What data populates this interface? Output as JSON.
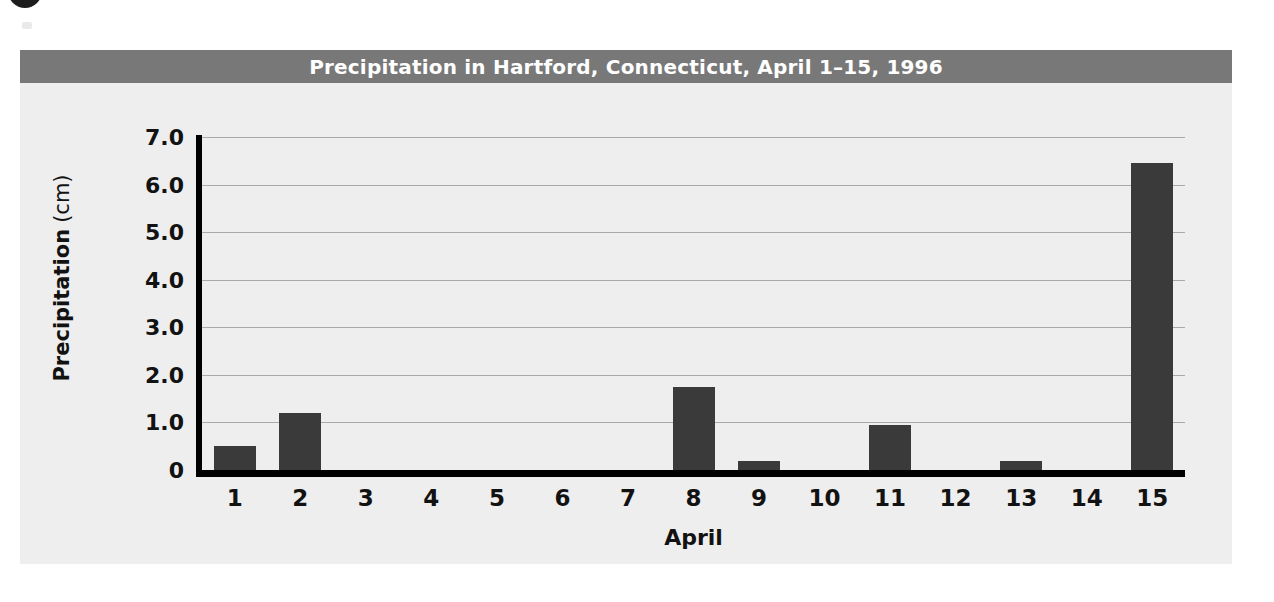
{
  "figure": {
    "title": "Precipitation in Hartford, Connecticut, April 1–15, 1996",
    "title_bar_color": "#787878",
    "title_text_color": "#ffffff",
    "panel_color": "#eeeeee",
    "corner_badge": "dark-circle-bullet"
  },
  "chart_data": {
    "type": "bar",
    "title": "Precipitation in Hartford, Connecticut, April 1–15, 1996",
    "xlabel": "April",
    "ylabel": "Precipitation",
    "ylabel_unit": "(cm)",
    "ylabel_full": "Precipitation (cm)",
    "categories": [
      "1",
      "2",
      "3",
      "4",
      "5",
      "6",
      "7",
      "8",
      "9",
      "10",
      "11",
      "12",
      "13",
      "14",
      "15"
    ],
    "values": [
      0.5,
      1.2,
      0,
      0,
      0,
      0,
      0,
      1.75,
      0.2,
      0,
      0.95,
      0,
      0.2,
      0,
      6.45
    ],
    "ylim": [
      0,
      7.0
    ],
    "yticks": [
      0,
      1.0,
      2.0,
      3.0,
      4.0,
      5.0,
      6.0,
      7.0
    ],
    "ytick_labels": [
      "0",
      "1.0",
      "2.0",
      "3.0",
      "4.0",
      "5.0",
      "6.0",
      "7.0"
    ],
    "grid": true,
    "grid_color": "#a9a9a9",
    "legend": null,
    "bar_color": "#3a3a3a",
    "axis_color": "#000000"
  }
}
